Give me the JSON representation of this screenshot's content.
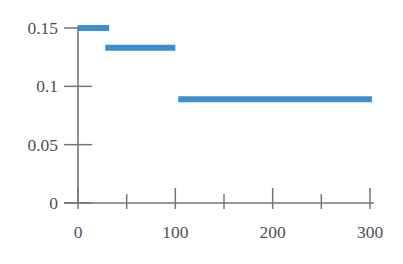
{
  "chart_data": {
    "type": "line",
    "subtype": "step-piecewise-constant",
    "title": "",
    "subtitle": "",
    "xlabel": "",
    "ylabel": "",
    "xlim": [
      -8,
      312
    ],
    "ylim": [
      0,
      0.158
    ],
    "grid": false,
    "legend": null,
    "series": [
      {
        "name": "step",
        "color": "#3d8fd0",
        "segments": [
          {
            "x_start": 0,
            "x_end": 32,
            "y": 0.15
          },
          {
            "x_start": 28,
            "x_end": 100,
            "y": 0.133
          },
          {
            "x_start": 103,
            "x_end": 302,
            "y": 0.089
          }
        ]
      }
    ],
    "x_ticks": [
      {
        "value": 0,
        "label": "0",
        "major": true
      },
      {
        "value": 50,
        "label": "",
        "major": false
      },
      {
        "value": 100,
        "label": "100",
        "major": true
      },
      {
        "value": 150,
        "label": "",
        "major": false
      },
      {
        "value": 200,
        "label": "200",
        "major": true
      },
      {
        "value": 250,
        "label": "",
        "major": false
      },
      {
        "value": 300,
        "label": "300",
        "major": true
      }
    ],
    "y_ticks": [
      {
        "value": 0,
        "label": "0"
      },
      {
        "value": 0.05,
        "label": "0.05"
      },
      {
        "value": 0.1,
        "label": "0.1"
      },
      {
        "value": 0.15,
        "label": "0.15"
      }
    ],
    "colors": {
      "series": "#3d8fd0",
      "axis": "#75767a",
      "label": "#4f5054",
      "background": "#ffffff"
    }
  }
}
